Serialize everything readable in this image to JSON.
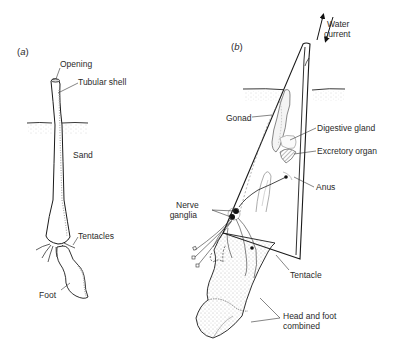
{
  "figure": {
    "panel_a": {
      "label_open": "(",
      "label_letter": "a",
      "label_close": ")",
      "labels": {
        "opening": "Opening",
        "tubular_shell": "Tubular shell",
        "sand": "Sand",
        "tentacles": "Tentacles",
        "foot": "Foot"
      }
    },
    "panel_b": {
      "label_open": "(",
      "label_letter": "b",
      "label_close": ")",
      "labels": {
        "water_current_1": "Water",
        "water_current_2": "current",
        "gonad": "Gonad",
        "digestive_gland": "Digestive gland",
        "excretory_organ": "Excretory organ",
        "anus": "Anus",
        "nerve_ganglia_1": "Nerve",
        "nerve_ganglia_2": "ganglia",
        "tentacle": "Tentacle",
        "head_foot_1": "Head and foot",
        "head_foot_2": "combined"
      }
    },
    "colors": {
      "line": "#1a1a1a",
      "stipple": "#9a9a9a",
      "background": "#ffffff"
    }
  }
}
